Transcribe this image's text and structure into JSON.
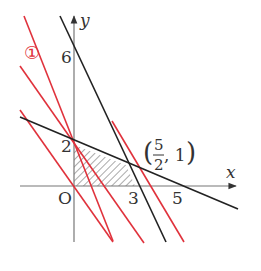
{
  "diagram": {
    "type": "linear-programming-region",
    "axes": {
      "x_label": "x",
      "y_label": "y",
      "origin_label": "O"
    },
    "tick_labels": {
      "y_6": "6",
      "y_2": "2",
      "x_3": "3",
      "x_5": "5"
    },
    "point_label": {
      "open": "(",
      "numerator": "5",
      "denominator": "2",
      "rest": ", 1",
      "close": ")"
    },
    "family_marker": "①",
    "lines": [
      {
        "name": "boundary-line-1",
        "equation": "2x + y = 6",
        "color": "#222222"
      },
      {
        "name": "boundary-line-2",
        "equation": "2x + 5y = 10",
        "color": "#222222"
      },
      {
        "name": "objective-line-family",
        "count": 4,
        "color": "#e0323c"
      }
    ],
    "shaded_region": "quadrilateral O(0,0), (0,2), (5/2,1), (3,0)",
    "colors": {
      "axis": "#777777",
      "black_line": "#222222",
      "red_line": "#e0323c",
      "hatch": "#555555"
    }
  }
}
